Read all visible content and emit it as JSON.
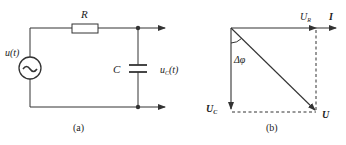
{
  "circuit": {
    "caption": "(a)",
    "resistor_label": "R",
    "capacitor_label": "C",
    "source_label": "u(t)",
    "source_symbol": "~",
    "output_label_main": "u",
    "output_label_sub": "C",
    "output_label_tail": "(t)"
  },
  "phasor": {
    "caption": "(b)",
    "current_label": "I",
    "ur_label_main": "U",
    "ur_label_sub": "R",
    "uc_label_main": "U",
    "uc_label_sub": "C",
    "u_label": "U",
    "angle_label": "Δφ"
  },
  "colors": {
    "stroke": "#333333",
    "text": "#222222",
    "background": "#ffffff"
  }
}
